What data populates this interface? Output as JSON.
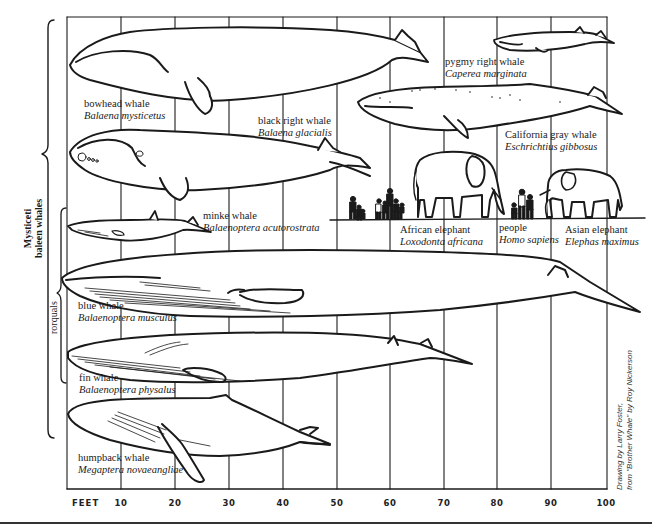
{
  "figure": {
    "axis_unit": "FEET",
    "ticks": [
      {
        "value": 10,
        "x": 121
      },
      {
        "value": 20,
        "x": 175
      },
      {
        "value": 30,
        "x": 229
      },
      {
        "value": 40,
        "x": 283
      },
      {
        "value": 50,
        "x": 337
      },
      {
        "value": 60,
        "x": 390
      },
      {
        "value": 70,
        "x": 444
      },
      {
        "value": 80,
        "x": 497
      },
      {
        "value": 90,
        "x": 551
      },
      {
        "value": 100,
        "x": 606
      }
    ],
    "groups": {
      "mysticeti_line1": "Mysticeti",
      "mysticeti_line2": "baleen whales",
      "rorquals": "rorquals"
    },
    "credit_line1": "Drawing by Larry Foster,",
    "credit_line2": "from \"Brother Whale\" by Roy Nickerson"
  },
  "animals": [
    {
      "id": "bowhead",
      "common": "bowhead whale",
      "scientific": "Balaena mysticetus"
    },
    {
      "id": "black-right",
      "common": "black right whale",
      "scientific": "Balaena glacialis"
    },
    {
      "id": "pygmy-right",
      "common": "pygmy right whale",
      "scientific": "Caperea marginata"
    },
    {
      "id": "gray",
      "common": "California gray whale",
      "scientific": "Eschrichtius gibbosus"
    },
    {
      "id": "minke",
      "common": "minke whale",
      "scientific": "Balaenoptera acutorostrata"
    },
    {
      "id": "african-elephant",
      "common": "African elephant",
      "scientific": "Loxodonta africana"
    },
    {
      "id": "people",
      "common": "people",
      "scientific": "Homo sapiens"
    },
    {
      "id": "asian-elephant",
      "common": "Asian elephant",
      "scientific": "Elephas maximus"
    },
    {
      "id": "blue",
      "common": "blue whale",
      "scientific": "Balaenoptera musculus"
    },
    {
      "id": "fin",
      "common": "fin whale",
      "scientific": "Balaenoptera physalus"
    },
    {
      "id": "humpback",
      "common": "humpback whale",
      "scientific": "Megaptera novaeangliae"
    }
  ]
}
